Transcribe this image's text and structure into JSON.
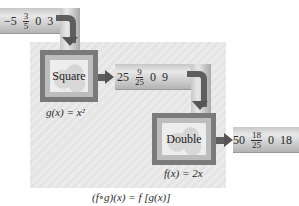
{
  "diagram": {
    "input": {
      "values": [
        {
          "type": "int",
          "text": "−5"
        },
        {
          "type": "frac",
          "num": "3",
          "den": "5"
        },
        {
          "type": "int",
          "text": "0"
        },
        {
          "type": "int",
          "text": "3"
        }
      ]
    },
    "machines": [
      {
        "label": "Square",
        "formula": "g(x) = x²"
      },
      {
        "label": "Double",
        "formula": "f(x) = 2x"
      }
    ],
    "intermediate": {
      "values": [
        {
          "type": "int",
          "text": "25"
        },
        {
          "type": "frac",
          "num": "9",
          "den": "25"
        },
        {
          "type": "int",
          "text": "0"
        },
        {
          "type": "int",
          "text": "9"
        }
      ]
    },
    "output": {
      "values": [
        {
          "type": "int",
          "text": "50"
        },
        {
          "type": "frac",
          "num": "18",
          "den": "25"
        },
        {
          "type": "int",
          "text": "0"
        },
        {
          "type": "int",
          "text": "18"
        }
      ]
    },
    "composition_caption": "(f∘g)(x) = f [g(x)]",
    "colors": {
      "machine_frame": "#7a7a7a",
      "arrow": "#5e5e5e",
      "panel": "#e8e8e8",
      "pipe": "#cfcfcf"
    }
  }
}
